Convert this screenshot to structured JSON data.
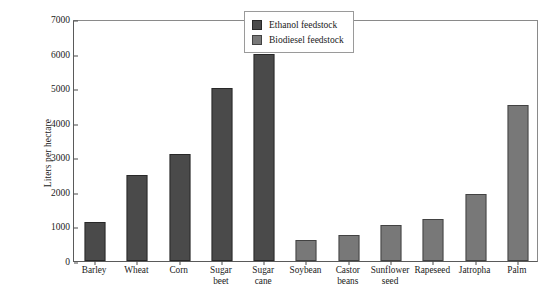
{
  "chart_data": {
    "type": "bar",
    "title": "",
    "xlabel": "",
    "ylabel": "Liters per hectare",
    "ylim": [
      0,
      7000
    ],
    "ytick_labels": [
      "0",
      "1000",
      "2000",
      "3000",
      "4000",
      "5000",
      "6000",
      "7000"
    ],
    "ytick_values": [
      0,
      1000,
      2000,
      3000,
      4000,
      5000,
      6000,
      7000
    ],
    "grid": false,
    "legend_position": "top-right-inside",
    "categories": [
      "Barley",
      "Wheat",
      "Corn",
      "Sugar\nbeet",
      "Sugar\ncane",
      "Soybean",
      "Castor\nbeans",
      "Sunflower\nseed",
      "Rapeseed",
      "Jatropha",
      "Palm"
    ],
    "series": [
      {
        "name": "Ethanol feedstock",
        "color": "#4a4a4a",
        "values": [
          1130,
          2500,
          3100,
          5000,
          6000,
          null,
          null,
          null,
          null,
          null,
          null
        ]
      },
      {
        "name": "Biodiesel feedstock",
        "color": "#787878",
        "values": [
          null,
          null,
          null,
          null,
          null,
          620,
          750,
          1030,
          1220,
          1950,
          4500
        ]
      }
    ],
    "legend": [
      {
        "label": "Ethanol feedstock",
        "color": "#4a4a4a"
      },
      {
        "label": "Biodiesel feedstock",
        "color": "#787878"
      }
    ]
  }
}
